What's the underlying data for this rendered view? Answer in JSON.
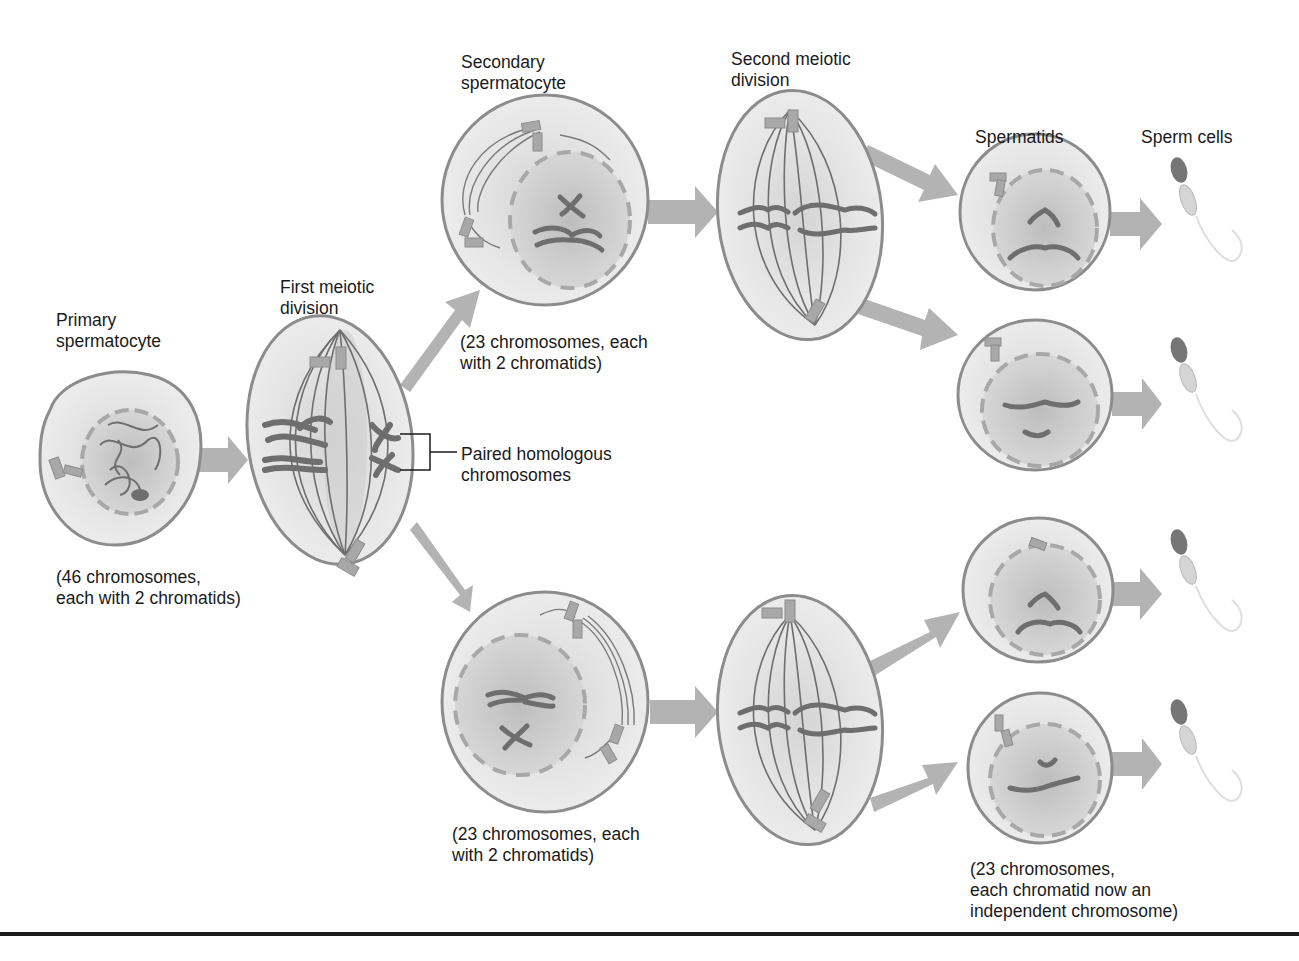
{
  "diagram": {
    "stages": {
      "primary": {
        "label": "Primary\nspermatocyte",
        "note": "(46 chromosomes,\neach with 2 chromatids)"
      },
      "first_division": {
        "label": "First meiotic\ndivision"
      },
      "secondary": {
        "label": "Secondary\nspermatocyte",
        "note_top": "(23 chromosomes, each\nwith 2 chromatids)",
        "note_bottom": "(23 chromosomes, each\nwith 2 chromatids)"
      },
      "second_division": {
        "label": "Second meiotic\ndivision"
      },
      "spermatids": {
        "label": "Spermatids",
        "note": "(23 chromosomes,\neach chromatid now an\nindependent chromosome)"
      },
      "sperm": {
        "label": "Sperm cells"
      }
    },
    "callout": {
      "label": "Paired homologous\nchromosomes"
    },
    "colors": {
      "cell_fill": "#e9e9e9",
      "cell_stroke": "#8c8c8c",
      "nucleus_fill": "#cfcfcf",
      "chromosome": "#6e6e6e",
      "arrow": "#b3b3b3",
      "rule": "#1c1c1c"
    }
  }
}
